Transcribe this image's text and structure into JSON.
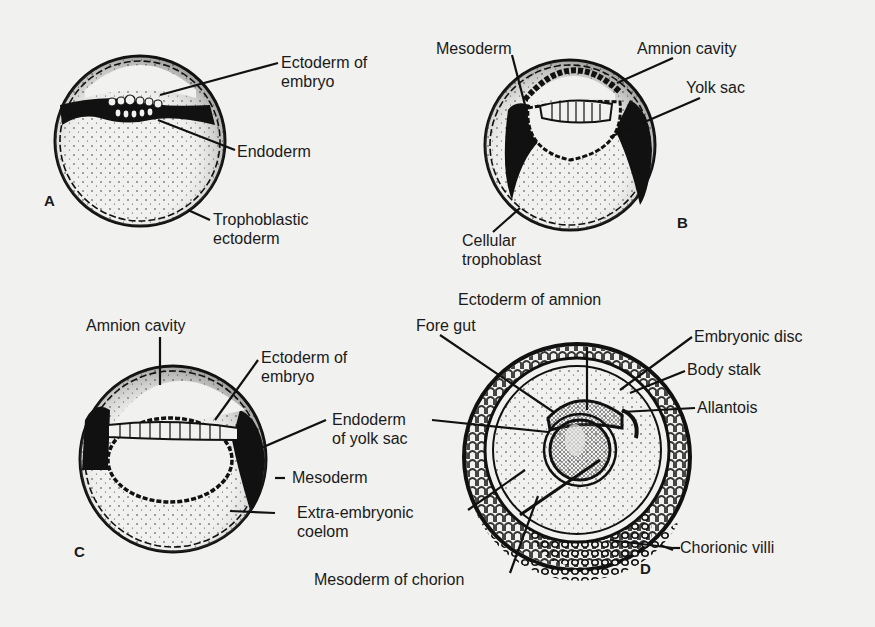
{
  "figure": {
    "background": "#f1f1ef",
    "ink": "#111111",
    "panels": [
      {
        "id": "A",
        "letter": "A",
        "labels": {
          "ectoderm_of_embryo_1": "Ectoderm of",
          "ectoderm_of_embryo_2": "embryo",
          "endoderm": "Endoderm",
          "trophoblastic_ectoderm_1": "Trophoblastic",
          "trophoblastic_ectoderm_2": "ectoderm"
        }
      },
      {
        "id": "B",
        "letter": "B",
        "labels": {
          "mesoderm": "Mesoderm",
          "amnion_cavity": "Amnion cavity",
          "yolk_sac": "Yolk sac",
          "cellular_trophoblast_1": "Cellular",
          "cellular_trophoblast_2": "trophoblast"
        }
      },
      {
        "id": "C",
        "letter": "C",
        "labels": {
          "amnion_cavity": "Amnion cavity",
          "ectoderm_of_embryo_1": "Ectoderm of",
          "ectoderm_of_embryo_2": "embryo",
          "endoderm_of_yolk_sac_1": "Endoderm",
          "endoderm_of_yolk_sac_2": "of yolk sac",
          "mesoderm": "Mesoderm",
          "extra_embryonic_coelom_1": "Extra-embryonic",
          "extra_embryonic_coelom_2": "coelom"
        }
      },
      {
        "id": "D",
        "letter": "D",
        "labels": {
          "ectoderm_of_amnion": "Ectoderm of amnion",
          "fore_gut": "Fore gut",
          "embryonic_disc": "Embryonic disc",
          "body_stalk": "Body stalk",
          "allantois": "Allantois",
          "chorionic_villi": "Chorionic villi",
          "mesoderm_of_chorion": "Mesoderm of chorion"
        }
      }
    ]
  }
}
